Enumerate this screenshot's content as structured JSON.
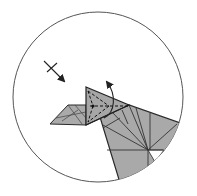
{
  "diagram": {
    "type": "origami-step-detail",
    "description": "Circular zoom callout showing folding step: valley-fold flap with swivel arrow",
    "colors": {
      "paper": "#a8a8a8",
      "paper_dark": "#9a9a9a",
      "line": "#2a2a2a",
      "circle": "#555555",
      "background": "#ffffff"
    },
    "circle": {
      "cx": 98,
      "cy": 97,
      "r": 85
    },
    "symbols": [
      {
        "name": "push-arrow",
        "meaning": "push / fold direction arrow with cross tick"
      },
      {
        "name": "fold-over-arrow",
        "meaning": "curved arrow indicating flap fold"
      },
      {
        "name": "valley-fold-lines",
        "meaning": "dashed valley fold lines"
      }
    ]
  }
}
